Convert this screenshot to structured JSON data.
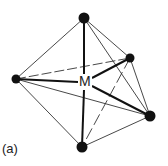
{
  "figure": {
    "caption": "(a)",
    "center_label": "M",
    "geometry": "octahedral",
    "colors": {
      "line": "#222222",
      "atom": "#111111"
    }
  },
  "atoms": [
    {
      "id": "top",
      "x": 84,
      "y": 18
    },
    {
      "id": "left",
      "x": 16,
      "y": 79
    },
    {
      "id": "back-right",
      "x": 130,
      "y": 58
    },
    {
      "id": "front-right",
      "x": 150,
      "y": 116
    },
    {
      "id": "bottom",
      "x": 82,
      "y": 147
    }
  ]
}
